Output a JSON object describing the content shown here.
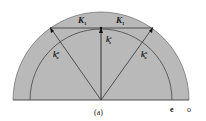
{
  "figure": {
    "caption": "(a)",
    "labels": {
      "k1_left": "K",
      "k1_left_sub": "1",
      "k1_right": "K",
      "k1_right_sub": "1",
      "kz": "k",
      "kz_sub": "z",
      "kz_sup": "e",
      "ko_left": "k",
      "ko_left_sub": "o",
      "ko_left_sup": "o",
      "ko_right": "k",
      "ko_right_sub": "o",
      "ko_right_sup": "o",
      "inner_circle": "e",
      "outer_circle": "o"
    },
    "colors": {
      "fill": "#b9b9b9",
      "stroke": "#3a3a3a",
      "background": "#ffffff"
    }
  }
}
